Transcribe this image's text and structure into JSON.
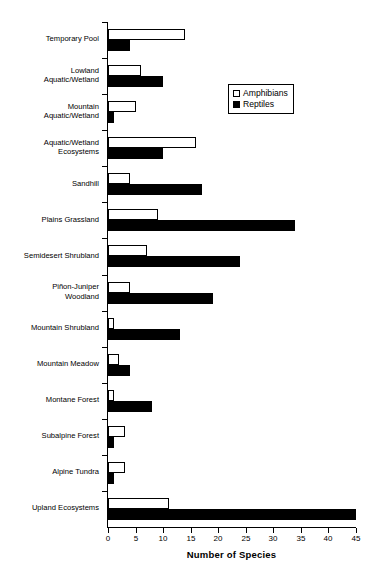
{
  "chart_data": {
    "type": "bar",
    "orientation": "horizontal",
    "title": "",
    "xlabel": "Number of Species",
    "ylabel": "",
    "xlim": [
      0,
      45
    ],
    "xticks": [
      0,
      5,
      10,
      15,
      20,
      25,
      30,
      35,
      40,
      45
    ],
    "grid": false,
    "legend_position": "upper-right-inside",
    "categories": [
      "Temporary Pool",
      "Lowland\nAquatic/Wetland",
      "Mountain\nAquatic/Wetland",
      "Aquatic/Wetland\nEcosystems",
      "Sandhill",
      "Plains Grassland",
      "Semidesert Shrubland",
      "Piñon-Juniper\nWoodland",
      "Mountain Shrubland",
      "Mountain Meadow",
      "Montane Forest",
      "Subalpine Forest",
      "Alpine Tundra",
      "Upland Ecosystems"
    ],
    "series": [
      {
        "name": "Amphibians",
        "color": "#ffffff",
        "edge_color": "#000000",
        "values": [
          14,
          6,
          5,
          16,
          4,
          9,
          7,
          4,
          1,
          2,
          1,
          3,
          3,
          11
        ]
      },
      {
        "name": "Reptiles",
        "color": "#000000",
        "edge_color": "#000000",
        "values": [
          4,
          10,
          1,
          10,
          17,
          34,
          24,
          19,
          13,
          4,
          8,
          1,
          1,
          45
        ]
      }
    ]
  },
  "legend": {
    "items": [
      {
        "label": "Amphibians",
        "style": "open"
      },
      {
        "label": "Reptiles",
        "style": "filled"
      }
    ]
  },
  "axis": {
    "x_title": "Number of Species"
  }
}
